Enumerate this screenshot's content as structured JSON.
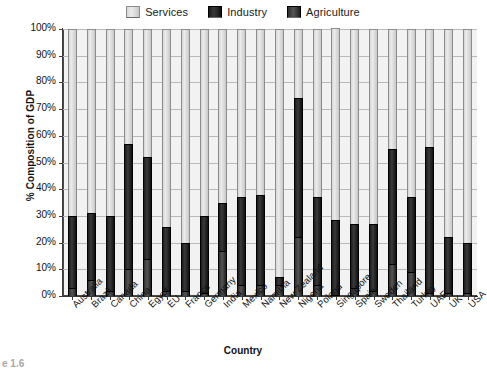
{
  "chart_data": {
    "type": "bar",
    "title": "",
    "xlabel": "Country",
    "ylabel": "% Composition of GDP",
    "ylim": [
      0,
      100
    ],
    "ytick_labels": [
      "0%",
      "10%",
      "20%",
      "30%",
      "40%",
      "50%",
      "60%",
      "70%",
      "80%",
      "90%",
      "100%"
    ],
    "ytick_values": [
      0,
      10,
      20,
      30,
      40,
      50,
      60,
      70,
      80,
      90,
      100
    ],
    "grid": true,
    "legend_position": "top",
    "stacked": true,
    "stack_order_bottom_to_top": [
      "Agriculture",
      "Industry",
      "Services"
    ],
    "categories": [
      "Australia",
      "Brazil",
      "Canada",
      "China",
      "Egypt",
      "EU",
      "France",
      "Germany",
      "India",
      "Mexico",
      "Namibia",
      "New Zealand",
      "Nigeria",
      "Poland",
      "Singapore",
      "Spain",
      "Sweden",
      "Thailand",
      "Turkey",
      "UAE",
      "UK",
      "USA"
    ],
    "series": [
      {
        "name": "Agriculture",
        "color": "#2e2e2e",
        "values": [
          3,
          6,
          2,
          10,
          14,
          2,
          2,
          1,
          17,
          4,
          4,
          4,
          22,
          4,
          0,
          3,
          2,
          12,
          9,
          1,
          1,
          1
        ]
      },
      {
        "name": "Industry",
        "color": "#141414",
        "values": [
          27,
          25,
          28,
          47,
          38,
          24,
          18,
          29,
          18,
          33,
          34,
          3,
          52,
          33,
          28,
          24,
          25,
          43,
          28,
          55,
          21,
          19
        ]
      },
      {
        "name": "Services",
        "color": "#dcdcdc",
        "values": [
          70,
          69,
          70,
          43,
          48,
          74,
          80,
          70,
          65,
          63,
          62,
          93,
          26,
          63,
          72,
          73,
          73,
          45,
          63,
          44,
          78,
          80
        ]
      }
    ],
    "cumulative_tops": {
      "agriculture_top": [
        3,
        6,
        2,
        10,
        14,
        2,
        2,
        1,
        17,
        4,
        4,
        4,
        22,
        4,
        0,
        3,
        2,
        12,
        9,
        1,
        1,
        1
      ],
      "industry_top": [
        30,
        31,
        30,
        57,
        52,
        26,
        20,
        30,
        35,
        37,
        38,
        7,
        74,
        37,
        28,
        27,
        27,
        55,
        37,
        56,
        22,
        20
      ]
    }
  },
  "legend": {
    "items": [
      {
        "label": "Services",
        "swatch": "services-swatch"
      },
      {
        "label": "Industry",
        "swatch": "industry-swatch"
      },
      {
        "label": "Agriculture",
        "swatch": "agriculture-swatch"
      }
    ]
  },
  "caption": {
    "text": "e 1.6"
  }
}
